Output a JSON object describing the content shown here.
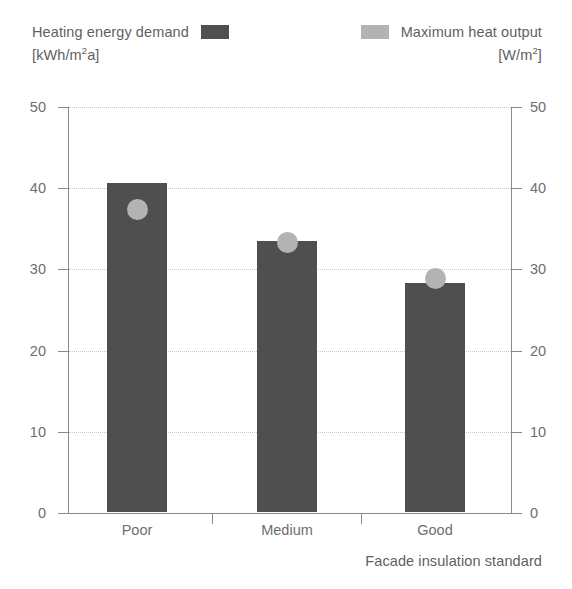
{
  "legend": {
    "left": {
      "label": "Heating energy demand",
      "units_prefix": "[kWh/m",
      "units_sup": "2",
      "units_suffix": "a]",
      "units_full": "[kWh/m2a]",
      "swatch_color": "#4f4f4f",
      "swatch_name": "dark-gray-bar-swatch"
    },
    "right": {
      "label": "Maximum heat output",
      "units_prefix": "[W/m",
      "units_sup": "2",
      "units_suffix": "]",
      "units_full": "[W/m2]",
      "swatch_color": "#b3b3b3",
      "swatch_name": "light-gray-circle-swatch"
    }
  },
  "chart_data": {
    "type": "bar",
    "title": "",
    "categories": [
      "Poor",
      "Medium",
      "Good"
    ],
    "series": [
      {
        "name": "Heating energy demand",
        "unit": "kWh/m2a",
        "render": "bar",
        "color": "#4f4f4f",
        "axis": "left",
        "values": [
          40.5,
          33.4,
          28.2
        ]
      },
      {
        "name": "Maximum heat output",
        "unit": "W/m2",
        "render": "marker-circle",
        "color": "#b3b3b3",
        "axis": "right",
        "values": [
          37.4,
          33.3,
          28.9
        ]
      }
    ],
    "xlabel": "Facade insulation standard",
    "ylabel_left": "[kWh/m2a]",
    "ylabel_right": "[W/m2]",
    "ylim": [
      0,
      50
    ],
    "ylim_right": [
      0,
      50
    ],
    "yticks": [
      0,
      10,
      20,
      30,
      40,
      50
    ],
    "yticks_right": [
      0,
      10,
      20,
      30,
      40,
      50
    ],
    "ytick_labels": [
      "0",
      "10",
      "20",
      "30",
      "40",
      "50"
    ],
    "grid": "horizontal-dotted",
    "legend_position": "top"
  },
  "axes": {
    "left_ticks": [
      "50",
      "40",
      "30",
      "20",
      "10",
      "0"
    ],
    "right_ticks": [
      "50",
      "40",
      "30",
      "20",
      "10",
      "0"
    ],
    "x_title": "Facade insulation standard"
  }
}
